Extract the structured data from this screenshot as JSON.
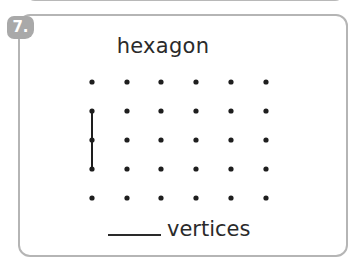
{
  "question": {
    "number": "7.",
    "shape_name": "hexagon",
    "answer_blank": "",
    "answer_suffix": "vertices"
  },
  "dot_grid": {
    "columns": 6,
    "rows": 5,
    "col_x": [
      92,
      127,
      161,
      196,
      231,
      266
    ],
    "row_y": [
      82,
      111,
      140,
      169,
      198
    ],
    "drawn_segments": [
      {
        "from": [
          0,
          1
        ],
        "to": [
          0,
          3
        ],
        "points": [
          [
            0,
            1
          ],
          [
            0,
            2
          ],
          [
            0,
            3
          ]
        ]
      }
    ]
  },
  "colors": {
    "border": "#b5b5b5",
    "badge": "#a9a9a9",
    "text": "#2a2a2a",
    "dot": "#1e1e1e"
  }
}
